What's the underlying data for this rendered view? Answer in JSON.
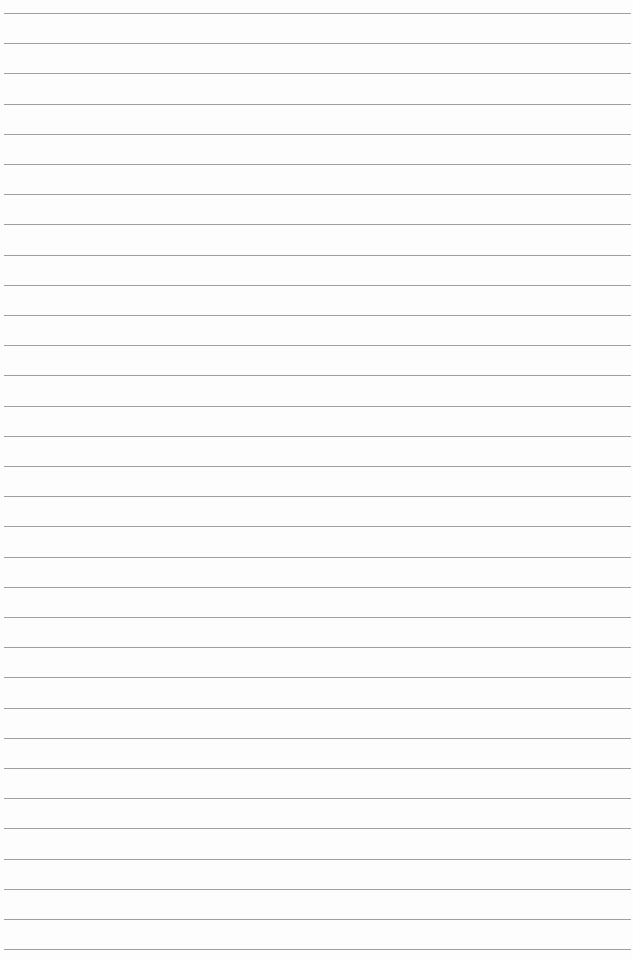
{
  "page": {
    "type": "lined-paper",
    "background_color": "#fdfdfd",
    "rule_color": "#8e8e8e",
    "rule_count": 32,
    "first_rule_y": 13,
    "rule_spacing": 30.2,
    "text_content": ""
  }
}
